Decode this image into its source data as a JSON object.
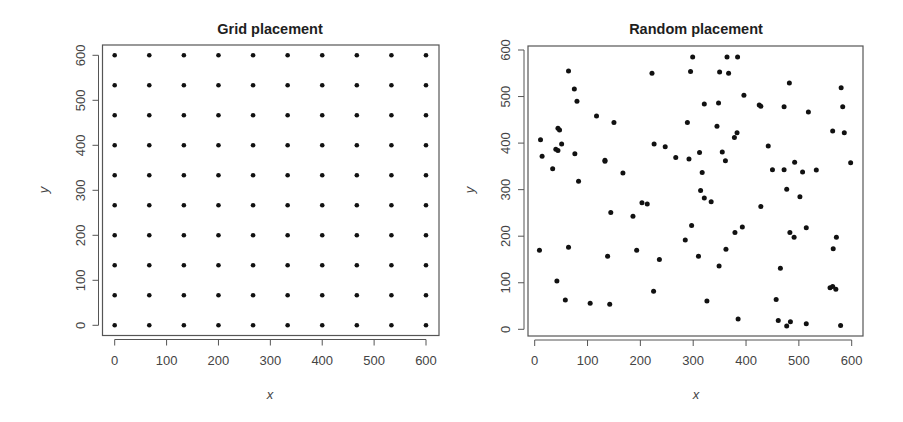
{
  "chart_data": [
    {
      "type": "scatter",
      "title": "Grid placement",
      "xlabel": "x",
      "ylabel": "y",
      "xlim": [
        0,
        600
      ],
      "ylim": [
        0,
        600
      ],
      "xticks": [
        0,
        100,
        200,
        300,
        400,
        500,
        600
      ],
      "yticks": [
        0,
        100,
        200,
        300,
        400,
        500,
        600
      ],
      "grid": false,
      "legend": null,
      "grid_spec": {
        "nx": 10,
        "ny": 10,
        "start": 0,
        "end": 600,
        "step": 66.67
      },
      "points": "10x10 regular lattice at x,y in {0,66.67,133.33,200,266.67,333.33,400,466.67,533.33,600}"
    },
    {
      "type": "scatter",
      "title": "Random placement",
      "xlabel": "x",
      "ylabel": "y",
      "xlim": [
        0,
        600
      ],
      "ylim": [
        0,
        600
      ],
      "xticks": [
        0,
        100,
        200,
        300,
        400,
        500,
        600
      ],
      "yticks": [
        0,
        100,
        200,
        300,
        400,
        500,
        600
      ],
      "grid": false,
      "legend": null,
      "x": [
        64,
        75,
        80,
        117,
        150,
        44,
        47,
        11,
        51,
        40,
        44,
        14,
        76,
        133,
        133,
        34,
        167,
        83,
        222,
        226,
        247,
        267,
        299,
        364,
        384,
        295,
        350,
        367,
        482,
        396,
        321,
        348,
        425,
        428,
        472,
        518,
        289,
        345,
        383,
        378,
        442,
        292,
        312,
        355,
        361,
        492,
        450,
        472,
        507,
        317,
        580,
        583,
        564,
        586,
        598,
        533,
        502,
        514,
        483,
        491,
        571,
        565,
        559,
        564,
        570,
        484,
        514,
        579,
        203,
        213,
        144,
        186,
        285,
        9,
        64,
        138,
        193,
        236,
        42,
        225,
        58,
        105,
        142,
        314,
        321,
        334,
        428,
        477,
        297,
        393,
        379,
        362,
        310,
        349,
        465,
        326,
        457,
        385,
        461,
        477,
        400
      ],
      "y": [
        555,
        516,
        490,
        458,
        444,
        432,
        428,
        407,
        398,
        387,
        384,
        372,
        377,
        363,
        361,
        345,
        336,
        318,
        550,
        398,
        392,
        369,
        585,
        585,
        585,
        554,
        553,
        550,
        529,
        503,
        484,
        486,
        482,
        479,
        478,
        467,
        444,
        436,
        422,
        412,
        394,
        366,
        380,
        381,
        362,
        359,
        343,
        343,
        338,
        337,
        519,
        478,
        426,
        422,
        358,
        342,
        285,
        218,
        208,
        198,
        198,
        173,
        89,
        92,
        86,
        16,
        12,
        8,
        272,
        269,
        251,
        243,
        192,
        170,
        176,
        157,
        170,
        150,
        104,
        82,
        63,
        56,
        54,
        298,
        282,
        274,
        264,
        301,
        223,
        220,
        208,
        172,
        157,
        136,
        131,
        61,
        64,
        22,
        19,
        7,
        0
      ]
    }
  ]
}
